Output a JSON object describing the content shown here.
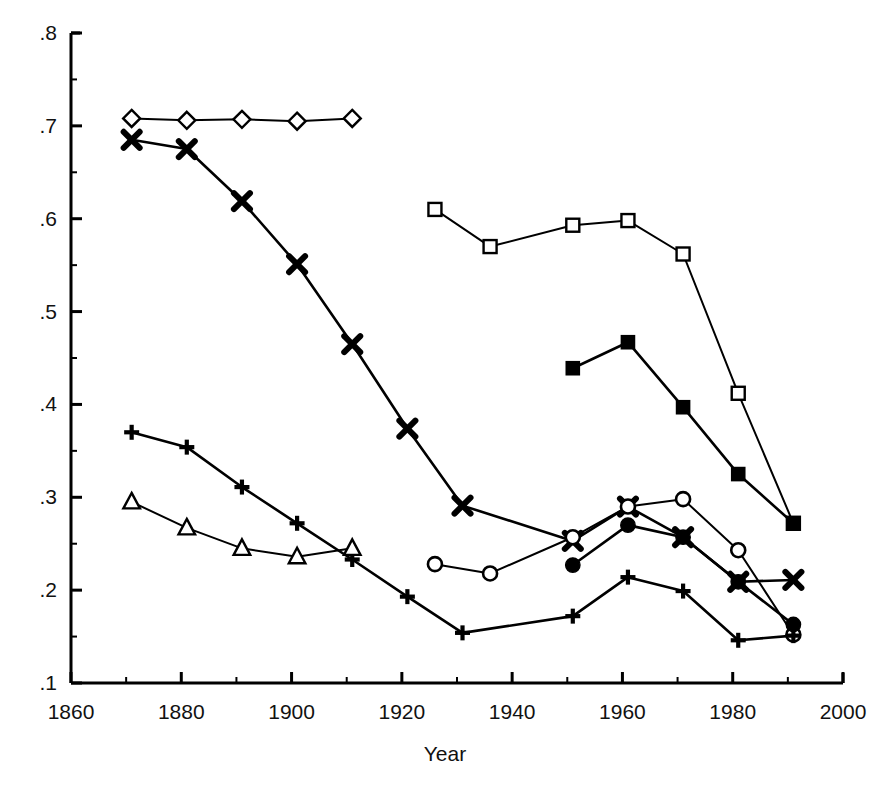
{
  "chart": {
    "title": "",
    "x_axis_title": "Year",
    "y_axis_title": "",
    "y_tick_labels": [
      ".8",
      ".7",
      ".6",
      ".5",
      ".4",
      ".3",
      ".2",
      ".1"
    ],
    "x_tick_labels": [
      "1860",
      "1880",
      "1900",
      "1920",
      "1940",
      "1960",
      "1980",
      "2000"
    ],
    "line_color": "#000000",
    "background_color": "#ffffff"
  },
  "chart_data": {
    "type": "line",
    "title": "",
    "xlabel": "Year",
    "ylabel": "",
    "xlim": [
      1860,
      2000
    ],
    "ylim": [
      0.1,
      0.8
    ],
    "xticks": [
      1860,
      1880,
      1900,
      1920,
      1940,
      1960,
      1980,
      2000
    ],
    "yticks": [
      0.1,
      0.2,
      0.3,
      0.4,
      0.5,
      0.6,
      0.7,
      0.8
    ],
    "minor_xticks": [
      1870,
      1890,
      1910,
      1930,
      1950,
      1970,
      1990
    ],
    "minor_yticks": [
      0.15,
      0.25,
      0.35,
      0.45,
      0.55,
      0.65,
      0.75
    ],
    "grid": false,
    "legend": "none",
    "series": [
      {
        "name": "open-diamond",
        "marker": "open-diamond",
        "x": [
          1871,
          1881,
          1891,
          1901,
          1911
        ],
        "values": [
          0.708,
          0.706,
          0.707,
          0.705,
          0.708
        ]
      },
      {
        "name": "bold-cross",
        "marker": "bold-cross",
        "x": [
          1871,
          1881,
          1891,
          1901,
          1911,
          1921,
          1931,
          1951,
          1961,
          1971,
          1981,
          1991
        ],
        "values": [
          0.685,
          0.675,
          0.619,
          0.551,
          0.465,
          0.374,
          0.291,
          0.253,
          0.29,
          0.257,
          0.209,
          0.211
        ]
      },
      {
        "name": "open-square",
        "marker": "open-square",
        "x": [
          1926,
          1936,
          1951,
          1961,
          1971,
          1981,
          1991
        ],
        "values": [
          0.61,
          0.57,
          0.593,
          0.598,
          0.562,
          0.412,
          0.272
        ]
      },
      {
        "name": "filled-square",
        "marker": "filled-square",
        "x": [
          1951,
          1961,
          1971,
          1981,
          1991
        ],
        "values": [
          0.439,
          0.467,
          0.397,
          0.325,
          0.272
        ]
      },
      {
        "name": "open-circle",
        "marker": "open-circle",
        "x": [
          1926,
          1936,
          1951,
          1961,
          1971,
          1981,
          1991
        ],
        "values": [
          0.228,
          0.218,
          0.257,
          0.29,
          0.298,
          0.243,
          0.152
        ]
      },
      {
        "name": "filled-circle",
        "marker": "filled-circle",
        "x": [
          1951,
          1961,
          1971,
          1981,
          1991
        ],
        "values": [
          0.227,
          0.27,
          0.257,
          0.209,
          0.163
        ]
      },
      {
        "name": "plus",
        "marker": "plus",
        "x": [
          1871,
          1881,
          1891,
          1901,
          1911,
          1921,
          1931,
          1951,
          1961,
          1971,
          1981,
          1991
        ],
        "values": [
          0.37,
          0.354,
          0.311,
          0.272,
          0.233,
          0.193,
          0.154,
          0.172,
          0.214,
          0.199,
          0.146,
          0.151
        ]
      },
      {
        "name": "open-triangle",
        "marker": "open-triangle",
        "x": [
          1871,
          1881,
          1891,
          1901,
          1911
        ],
        "values": [
          0.295,
          0.267,
          0.245,
          0.236,
          0.245
        ]
      }
    ]
  }
}
